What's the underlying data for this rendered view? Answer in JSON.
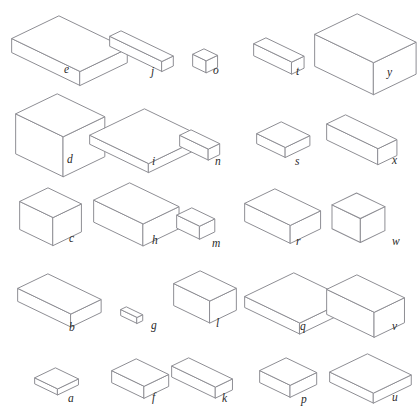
{
  "page": {
    "background_color": "#ffffff",
    "line_color": "#8e8e94",
    "label_color": "#2a2a2a",
    "width": 420,
    "height": 407,
    "cutoff_header_text": "· · ··· ·"
  },
  "grid": {
    "rows": 5,
    "columns": 5
  },
  "shapes": [
    {
      "label": "e",
      "x": 10,
      "y": 14,
      "w": 72,
      "d": 50,
      "h": 14,
      "label_x": 64,
      "label_y": 64
    },
    {
      "label": "j",
      "x": 108,
      "y": 29,
      "w": 55,
      "d": 12,
      "h": 10,
      "label_x": 151,
      "label_y": 66
    },
    {
      "label": "o",
      "x": 191,
      "y": 47,
      "w": 14,
      "d": 12,
      "h": 12,
      "label_x": 213,
      "label_y": 65
    },
    {
      "label": "t",
      "x": 252,
      "y": 36,
      "w": 40,
      "d": 13,
      "h": 12,
      "label_x": 296,
      "label_y": 66
    },
    {
      "label": "y",
      "x": 313,
      "y": 12,
      "w": 62,
      "d": 45,
      "h": 32,
      "label_x": 387,
      "label_y": 67
    },
    {
      "label": "d",
      "x": 14,
      "y": 92,
      "w": 50,
      "d": 44,
      "h": 40,
      "label_x": 67,
      "label_y": 154
    },
    {
      "label": "i",
      "x": 88,
      "y": 107,
      "w": 62,
      "d": 58,
      "h": 9,
      "label_x": 152,
      "label_y": 156
    },
    {
      "label": "n",
      "x": 178,
      "y": 128,
      "w": 30,
      "d": 12,
      "h": 11,
      "label_x": 215,
      "label_y": 156
    },
    {
      "label": "s",
      "x": 255,
      "y": 120,
      "w": 30,
      "d": 26,
      "h": 10,
      "label_x": 295,
      "label_y": 156
    },
    {
      "label": "x",
      "x": 325,
      "y": 113,
      "w": 54,
      "d": 20,
      "h": 16,
      "label_x": 392,
      "label_y": 155
    },
    {
      "label": "c",
      "x": 18,
      "y": 186,
      "w": 35,
      "d": 30,
      "h": 28,
      "label_x": 69,
      "label_y": 233
    },
    {
      "label": "h",
      "x": 92,
      "y": 181,
      "w": 52,
      "d": 38,
      "h": 22,
      "label_x": 152,
      "label_y": 235
    },
    {
      "label": "m",
      "x": 175,
      "y": 206,
      "w": 24,
      "d": 16,
      "h": 13,
      "label_x": 212,
      "label_y": 238
    },
    {
      "label": "r",
      "x": 243,
      "y": 187,
      "w": 48,
      "d": 32,
      "h": 18,
      "label_x": 296,
      "label_y": 236
    },
    {
      "label": "w",
      "x": 330,
      "y": 191,
      "w": 30,
      "d": 26,
      "h": 24,
      "label_x": 392,
      "label_y": 236
    },
    {
      "label": "b",
      "x": 16,
      "y": 272,
      "w": 56,
      "d": 32,
      "h": 13,
      "label_x": 69,
      "label_y": 322
    },
    {
      "label": "g",
      "x": 119,
      "y": 305,
      "w": 17,
      "d": 6,
      "h": 6,
      "label_x": 151,
      "label_y": 320
    },
    {
      "label": "l",
      "x": 172,
      "y": 269,
      "w": 38,
      "d": 28,
      "h": 22,
      "label_x": 216,
      "label_y": 318
    },
    {
      "label": "q",
      "x": 243,
      "y": 271,
      "w": 58,
      "d": 52,
      "h": 11,
      "label_x": 300,
      "label_y": 321
    },
    {
      "label": "v",
      "x": 325,
      "y": 273,
      "w": 50,
      "d": 32,
      "h": 25,
      "label_x": 392,
      "label_y": 321
    },
    {
      "label": "a",
      "x": 33,
      "y": 366,
      "w": 24,
      "d": 22,
      "h": 6,
      "label_x": 68,
      "label_y": 393
    },
    {
      "label": "f",
      "x": 110,
      "y": 357,
      "w": 34,
      "d": 26,
      "h": 12,
      "label_x": 152,
      "label_y": 392
    },
    {
      "label": "k",
      "x": 170,
      "y": 356,
      "w": 46,
      "d": 18,
      "h": 11,
      "label_x": 222,
      "label_y": 393
    },
    {
      "label": "p",
      "x": 258,
      "y": 356,
      "w": 32,
      "d": 28,
      "h": 12,
      "label_x": 301,
      "label_y": 394
    },
    {
      "label": "u",
      "x": 328,
      "y": 352,
      "w": 46,
      "d": 40,
      "h": 10,
      "label_x": 392,
      "label_y": 392
    }
  ]
}
